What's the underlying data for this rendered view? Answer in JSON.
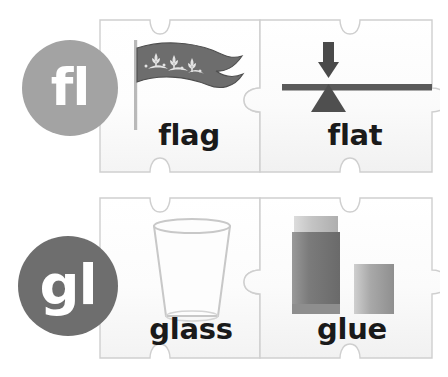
{
  "page": {
    "background_color": "#ffffff",
    "width": 448,
    "height": 377
  },
  "blend_groups": [
    {
      "id": "fl",
      "blend_label": "fl",
      "circle_color": "#a3a3a3",
      "circle_text_color": "#ffffff",
      "cards": [
        {
          "word": "flag",
          "icon": "flag-icon",
          "icon_description": "wavy pennant banner on a pole with fleur-de-lis pattern",
          "colors": {
            "banner": "#6d6d6d",
            "pole": "#b9b9b9",
            "ornament": "#e2e2e2"
          }
        },
        {
          "word": "flat",
          "icon": "balance-beam-icon",
          "icon_description": "level horizontal beam balanced on a triangular fulcrum with a downward arrow above",
          "colors": {
            "beam": "#5a5a5a",
            "fulcrum": "#4f4f4f",
            "arrow": "#4a4a4a"
          }
        }
      ]
    },
    {
      "id": "gl",
      "blend_label": "gl",
      "circle_color": "#6e6e6e",
      "circle_text_color": "#ffffff",
      "cards": [
        {
          "word": "glass",
          "icon": "drinking-glass-icon",
          "icon_description": "empty tapered tumbler drinking glass",
          "colors": {
            "body": "#fbfbfb",
            "outline": "#c8c8c8"
          }
        },
        {
          "word": "glue",
          "icon": "glue-stick-icon",
          "icon_description": "glue stick tube with its cap removed and placed beside it",
          "colors": {
            "body": "#7c7c7c",
            "collar": "#c9c9c9",
            "cap": "#a8a8a8"
          }
        }
      ]
    }
  ],
  "puzzle": {
    "piece_fill": "#fcfcfc",
    "piece_stroke": "#cfcfcf",
    "rows": 2,
    "columns": 2
  }
}
